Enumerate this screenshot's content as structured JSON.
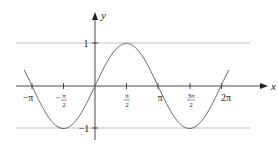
{
  "chart_data": {
    "type": "line",
    "title": "",
    "function": "y = sin(x)",
    "xlabel": "x",
    "ylabel": "y",
    "xlim": [
      -3.53,
      3.53
    ],
    "ylim": [
      -1,
      1
    ],
    "x_ticks": [
      "−π",
      "−π/2",
      "π/2",
      "π",
      "3π/2",
      "2π"
    ],
    "x_tick_values": [
      -3.1416,
      -1.5708,
      1.5708,
      3.1416,
      4.7124,
      6.2832
    ],
    "y_ticks": [
      "1",
      "−1"
    ],
    "y_tick_values": [
      1,
      -1
    ],
    "horizontal_reference_lines": [
      1,
      -1
    ],
    "series": [
      {
        "name": "sin x",
        "x_range": [
          -3.53,
          6.67
        ],
        "color": "#555555"
      }
    ],
    "key_points": [
      {
        "x": "−π",
        "y": 0
      },
      {
        "x": "−π/2",
        "y": -1
      },
      {
        "x": "0",
        "y": 0
      },
      {
        "x": "π/2",
        "y": 1
      },
      {
        "x": "π",
        "y": 0
      },
      {
        "x": "3π/2",
        "y": -1
      },
      {
        "x": "2π",
        "y": 0
      }
    ],
    "grid": false,
    "legend": "none"
  },
  "labels": {
    "x_axis": "x",
    "y_axis": "y",
    "neg_pi": "−π",
    "neg_pi_over_2_num": "π",
    "neg_pi_over_2_den": "2",
    "pi_over_2_num": "π",
    "pi_over_2_den": "2",
    "pi": "π",
    "three_pi_over_2_num": "3π",
    "three_pi_over_2_den": "2",
    "two_pi": "2π",
    "y_one": "1",
    "y_neg_one": "−1"
  },
  "colors": {
    "axis": "#222222",
    "curve": "#666666",
    "reference_lines": "#aaaaaa"
  }
}
